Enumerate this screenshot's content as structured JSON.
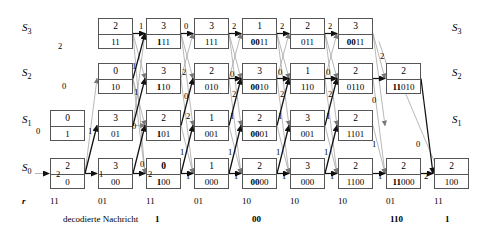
{
  "diagram": {
    "state_labels": [
      "S_3",
      "S_2",
      "S_1",
      "S_0"
    ],
    "state_labels_display": [
      {
        "base": "S",
        "sub": "3"
      },
      {
        "base": "S",
        "sub": "2"
      },
      {
        "base": "S",
        "sub": "1"
      },
      {
        "base": "S",
        "sub": "0"
      }
    ],
    "r_row_label": "r",
    "r_values": [
      "11",
      "01",
      "11",
      "01",
      "10",
      "10",
      "10",
      "01",
      "11"
    ],
    "decoded_caption": "decodierte Nachricht",
    "decoded_segments": [
      "1",
      "00",
      "110",
      "1"
    ],
    "nodes": {
      "S3": [
        {
          "col": 2,
          "metric": "2",
          "path": "11",
          "bold_prefix": 0
        },
        {
          "col": 3,
          "metric": "3",
          "path": "111",
          "bold_prefix": 1
        },
        {
          "col": 4,
          "metric": "3",
          "path": "111",
          "bold_prefix": 0
        },
        {
          "col": 5,
          "metric": "1",
          "path": "0011",
          "bold_prefix": 2
        },
        {
          "col": 6,
          "metric": "2",
          "path": "011",
          "bold_prefix": 0
        },
        {
          "col": 7,
          "metric": "3",
          "path": "0011",
          "bold_prefix": 2
        }
      ],
      "S2": [
        {
          "col": 2,
          "metric": "0",
          "path": "10",
          "bold_prefix": 0
        },
        {
          "col": 3,
          "metric": "3",
          "path": "110",
          "bold_prefix": 1
        },
        {
          "col": 4,
          "metric": "2",
          "path": "010",
          "bold_prefix": 0
        },
        {
          "col": 5,
          "metric": "3",
          "path": "0010",
          "bold_prefix": 2
        },
        {
          "col": 6,
          "metric": "1",
          "path": "110",
          "bold_prefix": 0
        },
        {
          "col": 7,
          "metric": "2",
          "path": "0110",
          "bold_prefix": 0
        },
        {
          "col": 8,
          "metric": "2",
          "path": "11010",
          "bold_prefix": 2
        }
      ],
      "S1": [
        {
          "col": 1,
          "metric": "0",
          "path": "1",
          "bold_prefix": 0
        },
        {
          "col": 2,
          "metric": "3",
          "path": "01",
          "bold_prefix": 0
        },
        {
          "col": 3,
          "metric": "2",
          "path": "101",
          "bold_prefix": 1
        },
        {
          "col": 4,
          "metric": "1",
          "path": "001",
          "bold_prefix": 0
        },
        {
          "col": 5,
          "metric": "2",
          "path": "0001",
          "bold_prefix": 2
        },
        {
          "col": 6,
          "metric": "3",
          "path": "001",
          "bold_prefix": 0
        },
        {
          "col": 7,
          "metric": "2",
          "path": "1101",
          "bold_prefix": 0
        }
      ],
      "S0": [
        {
          "col": 1,
          "metric": "2",
          "path": "0",
          "bold_prefix": 0
        },
        {
          "col": 2,
          "metric": "3",
          "path": "00",
          "bold_prefix": 0
        },
        {
          "col": 3,
          "metric": "0",
          "path": "100",
          "bold_prefix": 1,
          "bold_metric": true
        },
        {
          "col": 4,
          "metric": "1",
          "path": "000",
          "bold_prefix": 0
        },
        {
          "col": 5,
          "metric": "2",
          "path": "0000",
          "bold_prefix": 2
        },
        {
          "col": 6,
          "metric": "3",
          "path": "000",
          "bold_prefix": 0
        },
        {
          "col": 7,
          "metric": "2",
          "path": "1100",
          "bold_prefix": 0
        },
        {
          "col": 8,
          "metric": "2",
          "path": "11000",
          "bold_prefix": 2
        },
        {
          "col": 9,
          "metric": "2",
          "path": "100",
          "bold_prefix": 0
        }
      ]
    },
    "branch_metric_labels": [
      {
        "text": "2",
        "x": 56,
        "y": 170
      },
      {
        "text": "0",
        "x": 36,
        "y": 127
      },
      {
        "text": "1",
        "x": 99,
        "y": 170
      },
      {
        "text": "1",
        "x": 88,
        "y": 127
      },
      {
        "text": "0",
        "x": 62,
        "y": 82
      },
      {
        "text": "2",
        "x": 58,
        "y": 42
      },
      {
        "text": "2",
        "x": 148,
        "y": 170
      },
      {
        "text": "0",
        "x": 140,
        "y": 160
      },
      {
        "text": "0",
        "x": 132,
        "y": 122
      },
      {
        "text": "1",
        "x": 134,
        "y": 88
      },
      {
        "text": "1",
        "x": 132,
        "y": 62
      },
      {
        "text": "1",
        "x": 139,
        "y": 22
      },
      {
        "text": "1",
        "x": 186,
        "y": 172
      },
      {
        "text": "1",
        "x": 180,
        "y": 148
      },
      {
        "text": "2",
        "x": 186,
        "y": 112
      },
      {
        "text": "0",
        "x": 184,
        "y": 92
      },
      {
        "text": "2",
        "x": 182,
        "y": 68
      },
      {
        "text": "0",
        "x": 184,
        "y": 22
      },
      {
        "text": "1",
        "x": 234,
        "y": 172
      },
      {
        "text": "1",
        "x": 228,
        "y": 148
      },
      {
        "text": "1",
        "x": 230,
        "y": 112
      },
      {
        "text": "2",
        "x": 232,
        "y": 90
      },
      {
        "text": "0",
        "x": 230,
        "y": 70
      },
      {
        "text": "2",
        "x": 232,
        "y": 22
      },
      {
        "text": "1",
        "x": 282,
        "y": 172
      },
      {
        "text": "1",
        "x": 276,
        "y": 148
      },
      {
        "text": "1",
        "x": 278,
        "y": 112
      },
      {
        "text": "2",
        "x": 280,
        "y": 90
      },
      {
        "text": "0",
        "x": 278,
        "y": 68
      },
      {
        "text": "2",
        "x": 280,
        "y": 22
      },
      {
        "text": "1",
        "x": 330,
        "y": 172
      },
      {
        "text": "1",
        "x": 324,
        "y": 148
      },
      {
        "text": "1",
        "x": 326,
        "y": 112
      },
      {
        "text": "2",
        "x": 328,
        "y": 90
      },
      {
        "text": "0",
        "x": 326,
        "y": 68
      },
      {
        "text": "2",
        "x": 328,
        "y": 22
      },
      {
        "text": "1",
        "x": 378,
        "y": 172
      },
      {
        "text": "1",
        "x": 372,
        "y": 140
      },
      {
        "text": "0",
        "x": 372,
        "y": 96
      },
      {
        "text": "2",
        "x": 380,
        "y": 52
      },
      {
        "text": "2",
        "x": 424,
        "y": 172
      },
      {
        "text": "0",
        "x": 416,
        "y": 140
      }
    ]
  }
}
